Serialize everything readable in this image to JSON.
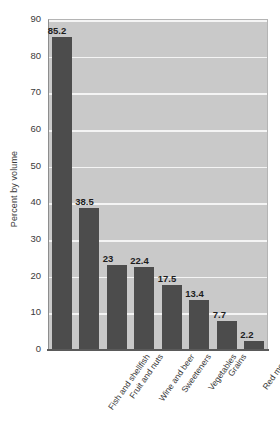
{
  "chart_data": {
    "type": "bar",
    "title": "",
    "subtitle": "",
    "xlabel": "",
    "ylabel": "Percent by volume",
    "ylim": [
      0,
      90
    ],
    "yticks": [
      0,
      10,
      20,
      30,
      40,
      50,
      60,
      70,
      80,
      90
    ],
    "ytick_labels": [
      "0",
      "10",
      "20",
      "30",
      "40",
      "50",
      "60",
      "70",
      "80",
      "90"
    ],
    "grid": true,
    "legend": false,
    "legend_position": "none",
    "categories": [
      "Fish and shellfish",
      "Fruit and nuts",
      "Wine and beer",
      "Sweeteners",
      "Vegetables",
      "Grains",
      "Red meats",
      "Dairy products"
    ],
    "values": [
      85.2,
      38.5,
      23,
      22.4,
      17.5,
      13.4,
      7.7,
      2.2
    ],
    "value_labels": [
      "85.2",
      "38.5",
      "23",
      "22.4",
      "17.5",
      "13.4",
      "7.7",
      "2.2"
    ],
    "colors": {
      "bar": "#4c4c4c",
      "plot_background": "#c9c9c9",
      "gridline": "#f4f4f4",
      "axis": "#5a5a5a",
      "text": "#3a3a3a",
      "page_background": "#ffffff"
    }
  }
}
